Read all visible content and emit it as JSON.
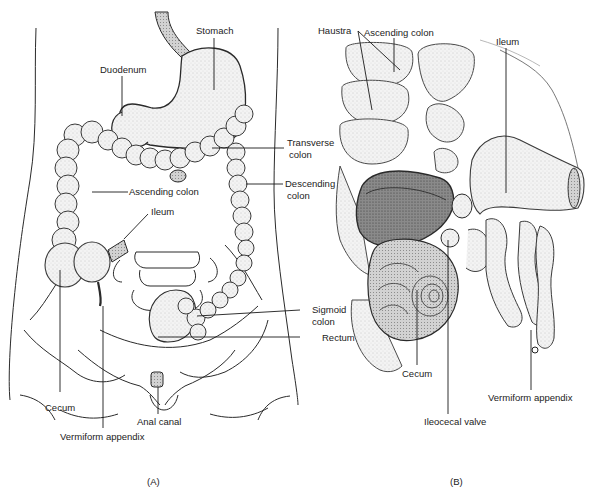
{
  "figure": {
    "panels": [
      {
        "id": "A",
        "caption": "(A)",
        "labels": {
          "stomach": "Stomach",
          "duodenum": "Duodenum",
          "transverse_colon_1": "Transverse",
          "transverse_colon_2": "colon",
          "descending_colon_1": "Descending",
          "descending_colon_2": "colon",
          "ascending_colon": "Ascending colon",
          "ileum": "Ileum",
          "sigmoid_colon_1": "Sigmoid",
          "sigmoid_colon_2": "colon",
          "rectum": "Rectum",
          "cecum": "Cecum",
          "anal_canal": "Anal canal",
          "vermiform_appendix": "Vermiform appendix"
        }
      },
      {
        "id": "B",
        "caption": "(B)",
        "labels": {
          "ascending_colon": "Ascending colon",
          "haustra": "Haustra",
          "ileum": "Ileum",
          "cecum": "Cecum",
          "ileocecal_valve": "Ileocecal valve",
          "vermiform_appendix": "Vermiform  appendix"
        }
      }
    ],
    "colors": {
      "line": "#2a2a2a",
      "shade_light": "#e6e6e6",
      "shade_mid": "#bdbdbd",
      "shade_dark": "#6e6e6e",
      "background": "#ffffff"
    }
  }
}
